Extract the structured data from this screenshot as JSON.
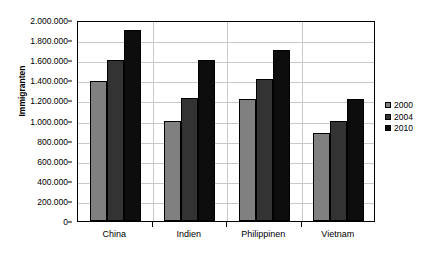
{
  "chart_data": {
    "type": "bar",
    "title": "",
    "xlabel": "",
    "ylabel": "Immigranten",
    "categories": [
      "China",
      "Indien",
      "Philippinen",
      "Vietnam"
    ],
    "series": [
      {
        "name": "2000",
        "color": "#808080",
        "values": [
          1390000,
          1000000,
          1210000,
          880000
        ]
      },
      {
        "name": "2004",
        "color": "#333333",
        "values": [
          1600000,
          1220000,
          1410000,
          1000000
        ]
      },
      {
        "name": "2010",
        "color": "#0d0d0d",
        "values": [
          1900000,
          1600000,
          1700000,
          1210000
        ]
      }
    ],
    "ylim": [
      0,
      2000000
    ],
    "y_ticks": [
      {
        "value": 2000000,
        "label": "2.000.000"
      },
      {
        "value": 1800000,
        "label": "1.800.000"
      },
      {
        "value": 1600000,
        "label": "1.600.000"
      },
      {
        "value": 1400000,
        "label": "1.400.000"
      },
      {
        "value": 1200000,
        "label": "1.200.000"
      },
      {
        "value": 1000000,
        "label": "1.000.000"
      },
      {
        "value": 800000,
        "label": "800.000"
      },
      {
        "value": 600000,
        "label": "600.000"
      },
      {
        "value": 400000,
        "label": "400.000"
      },
      {
        "value": 200000,
        "label": "200.000"
      },
      {
        "value": 0,
        "label": "0"
      }
    ],
    "grid": true,
    "legend_position": "right",
    "legend_entries": [
      "2000",
      "2004",
      "2010"
    ]
  }
}
